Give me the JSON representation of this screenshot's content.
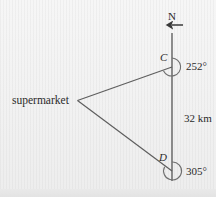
{
  "figure": {
    "type": "bearings-diagram",
    "background_color": "#f2f2f2",
    "ink_color": "#555555",
    "text_color": "#2a2a2a"
  },
  "labels": {
    "north": "N",
    "point_c": "C",
    "point_d": "D",
    "bearing_c": "252°",
    "bearing_d": "305°",
    "distance": "32 km",
    "origin": "supermarket"
  },
  "icons": {
    "north_arrow": "north-arrow-icon",
    "angle_arc_c": "angle-arc-icon",
    "angle_arc_d": "angle-arc-icon"
  },
  "geometry": {
    "north_line": {
      "x": 172,
      "y_top": 26,
      "y_bottom": 180
    },
    "point_c": {
      "x": 172,
      "y": 67
    },
    "point_d": {
      "x": 172,
      "y": 171
    },
    "supermarket": {
      "x": 77,
      "y": 100
    },
    "arc_radius": 9,
    "bearing_c_degrees": 252,
    "bearing_d_degrees": 305,
    "distance_km": 32
  }
}
